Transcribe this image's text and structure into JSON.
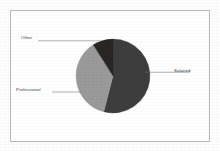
{
  "chart_data": {
    "type": "pie",
    "title": "",
    "subtitle": "",
    "xlabel": "",
    "ylabel": "",
    "legend_position": "none",
    "grid": false,
    "labels_outside": true,
    "categories": [
      "Salaried",
      "Professional",
      "Other"
    ],
    "values": [
      54,
      37,
      9
    ],
    "slices": [
      {
        "label": "Salaried",
        "value": 54,
        "color": "#3d3d3d",
        "start_angle_deg": 0,
        "end_angle_deg": 194.4,
        "leader_line": true
      },
      {
        "label": "Professional",
        "value": 37,
        "color": "#9a9a9a",
        "start_angle_deg": 194.4,
        "end_angle_deg": 327.6,
        "leader_line": true
      },
      {
        "label": "Other",
        "value": 9,
        "color": "#2a2626",
        "start_angle_deg": 327.6,
        "end_angle_deg": 360,
        "leader_line": true
      }
    ]
  },
  "figure": {
    "frame_border_color": "#b9b9b9",
    "background_color": "#ffffff",
    "page_background_color": "#fdfdfd",
    "leader_line_color": "#6f6f6f",
    "label_text_color": "#3a3a3a"
  },
  "geometry": {
    "center_x": 113,
    "center_y": 76,
    "radius": 37
  }
}
